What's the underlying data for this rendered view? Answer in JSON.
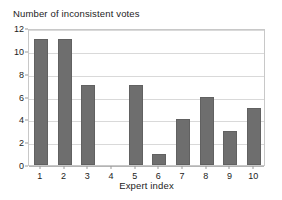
{
  "chart_data": {
    "type": "bar",
    "title": "Number of inconsistent votes",
    "xlabel": "Expert index",
    "ylabel": "",
    "categories": [
      "1",
      "2",
      "3",
      "4",
      "5",
      "6",
      "7",
      "8",
      "9",
      "10"
    ],
    "values": [
      11,
      11,
      7,
      0,
      7,
      1,
      4,
      6,
      3,
      5
    ],
    "ylim": [
      0,
      12
    ],
    "ytick_labels": [
      "0",
      "2",
      "4",
      "6",
      "8",
      "10",
      "12"
    ],
    "ytick_values": [
      0,
      2,
      4,
      6,
      8,
      10,
      12
    ],
    "grid": "horizontal",
    "legend": "none",
    "bar_color": "#6e6e6e",
    "gridline_color": "#d9d9d9",
    "frame_color": "#c8c8c8",
    "background": "#ffffff"
  }
}
